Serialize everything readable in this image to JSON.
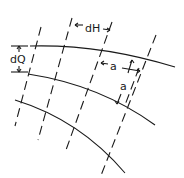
{
  "diagram": {
    "type": "flow-net",
    "labels": {
      "dH": "dH",
      "dQ": "dQ",
      "a_horizontal": "a",
      "a_vertical": "a"
    },
    "colors": {
      "line": "#1a1a1a",
      "background": "#ffffff"
    },
    "streamlines": 3,
    "equipotential_lines": 4
  }
}
